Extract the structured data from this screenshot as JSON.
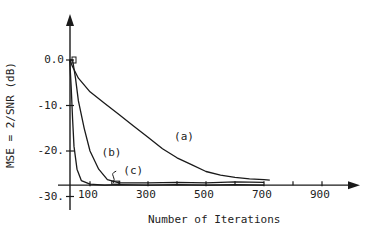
{
  "chart_data": {
    "type": "line",
    "title": "",
    "xlabel": "Number of Iterations",
    "ylabel": "MSE = 2/SNR (dB)",
    "xlim": [
      0,
      1000
    ],
    "ylim": [
      -30,
      5
    ],
    "x_axis_crosses_y_at": -27.5,
    "grid": false,
    "xticks": [
      100,
      300,
      500,
      700,
      900
    ],
    "xtick_labels": [
      "100",
      "300",
      "500",
      "700",
      "900"
    ],
    "minor_xticks": [
      200,
      400,
      600,
      800
    ],
    "yticks": [
      0,
      -10,
      -20,
      -30
    ],
    "ytick_labels": [
      "0.0",
      "-10.",
      "-20.",
      "-30."
    ],
    "series": [
      {
        "name": "(a)",
        "x": [
          30,
          40,
          60,
          100,
          150,
          200,
          250,
          300,
          350,
          400,
          450,
          500,
          550,
          600,
          650,
          700,
          720
        ],
        "y": [
          0,
          -1.5,
          -4,
          -7,
          -9.5,
          -12,
          -14.5,
          -17,
          -19.5,
          -21.5,
          -23,
          -24.5,
          -25.3,
          -25.8,
          -26.1,
          -26.3,
          -26.4
        ]
      },
      {
        "name": "(b)",
        "x": [
          30,
          40,
          50,
          60,
          80,
          100,
          130,
          160,
          200,
          300,
          400,
          500,
          600,
          700
        ],
        "y": [
          0,
          0,
          -4,
          -9,
          -15,
          -20,
          -24,
          -26.3,
          -27,
          -27,
          -26.9,
          -27,
          -26.8,
          -26.9
        ]
      },
      {
        "name": "(c)",
        "x": [
          30,
          35,
          40,
          45,
          55,
          70,
          100,
          150,
          200,
          300,
          400,
          500,
          600,
          700
        ],
        "y": [
          0,
          -6,
          -13,
          -19,
          -24,
          -26.5,
          -27.3,
          -27.5,
          -27.4,
          -27.5,
          -27.4,
          -27.5,
          -27.4,
          -27.5
        ]
      }
    ],
    "annotations": [
      {
        "text": "(a)",
        "x": 390,
        "y": -17
      },
      {
        "text": "(b)",
        "x": 140,
        "y": -20.5
      },
      {
        "text": "(c)",
        "x": 215,
        "y": -24.5
      }
    ]
  }
}
